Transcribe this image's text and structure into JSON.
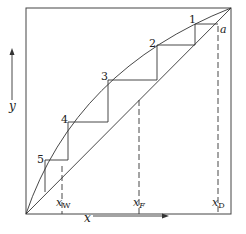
{
  "diagram": {
    "type": "mccabe-thiele-stepping",
    "axes": {
      "x_label": "x",
      "y_label": "y"
    },
    "stage_labels": [
      "1",
      "2",
      "3",
      "4",
      "5"
    ],
    "point_labels": {
      "a": "a"
    },
    "composition_marks": {
      "xW": {
        "main": "x",
        "sub": "W"
      },
      "xF": {
        "main": "x",
        "sub": "F"
      },
      "xD": {
        "main": "x",
        "sub": "D"
      }
    }
  }
}
